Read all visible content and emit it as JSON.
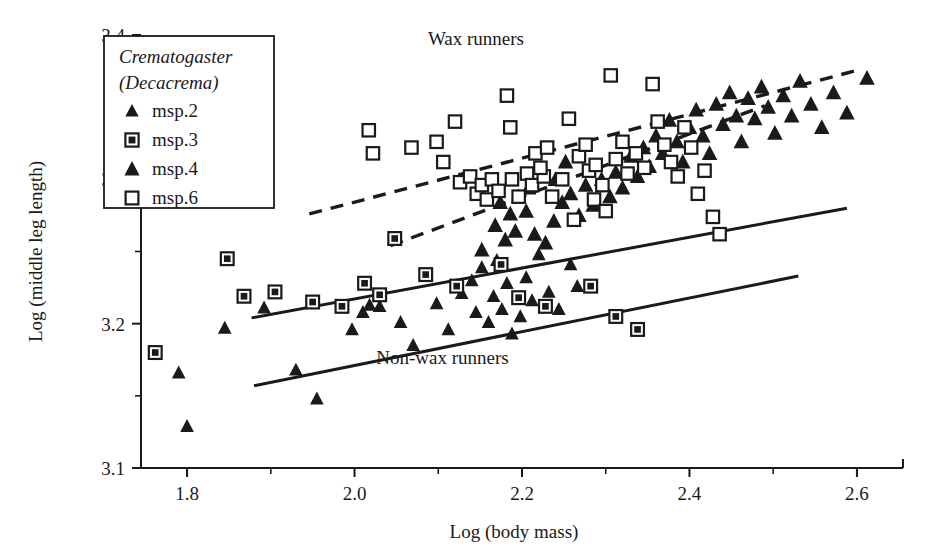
{
  "chart_data": {
    "type": "scatter",
    "title": "",
    "xlabel": "Log (body mass)",
    "ylabel": "Log (middle leg length)",
    "xlim": [
      1.745,
      2.655
    ],
    "ylim": [
      3.1,
      3.4
    ],
    "xticks": [
      1.8,
      2.0,
      2.2,
      2.4,
      2.6
    ],
    "xticklabels": [
      "1.8",
      "2.0",
      "2.2",
      "2.4",
      "2.6"
    ],
    "xminorticks": [
      1.9,
      2.1,
      2.3,
      2.5
    ],
    "yticks": [
      3.1,
      3.2,
      3.3,
      3.4
    ],
    "yticklabels": [
      "3.1",
      "3.2",
      "3.3",
      "3.4"
    ],
    "yminorticks": [
      3.15,
      3.25,
      3.35
    ],
    "grid": false,
    "legend_position": "top-left",
    "legend": {
      "title_line1": "Crematogaster",
      "title_line2": "(Decacrema)",
      "entries": [
        {
          "label": "msp.2",
          "marker": "triangle-small",
          "filled": true
        },
        {
          "label": "msp.3",
          "marker": "square-dotted",
          "filled": true
        },
        {
          "label": "msp.4",
          "marker": "triangle",
          "filled": true
        },
        {
          "label": "msp.6",
          "marker": "square-open",
          "filled": false
        }
      ]
    },
    "annotations": [
      {
        "text": "Wax runners",
        "x": 2.145,
        "y": 3.393
      },
      {
        "text": "Non-wax runners",
        "x": 2.105,
        "y": 3.172
      }
    ],
    "trendlines": [
      {
        "name": "wax-runners-upper-dashed",
        "style": "dashed",
        "x": [
          1.946,
          2.597
        ],
        "y": [
          3.276,
          3.375
        ]
      },
      {
        "name": "wax-runners-lower-dashed",
        "style": "dashed",
        "x": [
          2.043,
          2.49
        ],
        "y": [
          3.254,
          3.351
        ]
      },
      {
        "name": "non-wax-upper-solid",
        "style": "solid",
        "x": [
          1.877,
          2.588
        ],
        "y": [
          3.204,
          3.28
        ]
      },
      {
        "name": "non-wax-lower-solid",
        "style": "solid",
        "x": [
          1.88,
          2.53
        ],
        "y": [
          3.157,
          3.233
        ]
      }
    ],
    "series": [
      {
        "name": "msp.2",
        "marker": "triangle-small",
        "points": [
          [
            1.79,
            3.166
          ],
          [
            1.8,
            3.129
          ],
          [
            1.845,
            3.197
          ],
          [
            1.892,
            3.211
          ],
          [
            1.93,
            3.168
          ],
          [
            1.955,
            3.148
          ],
          [
            1.997,
            3.196
          ],
          [
            2.01,
            3.208
          ],
          [
            2.018,
            3.213
          ],
          [
            2.03,
            3.212
          ],
          [
            2.055,
            3.201
          ],
          [
            2.07,
            3.185
          ],
          [
            2.098,
            3.214
          ],
          [
            2.112,
            3.196
          ],
          [
            2.128,
            3.221
          ],
          [
            2.14,
            3.23
          ],
          [
            2.145,
            3.208
          ],
          [
            2.152,
            3.239
          ],
          [
            2.16,
            3.201
          ],
          [
            2.166,
            3.219
          ],
          [
            2.17,
            3.244
          ],
          [
            2.176,
            3.21
          ],
          [
            2.182,
            3.228
          ],
          [
            2.188,
            3.193
          ],
          [
            2.198,
            3.205
          ],
          [
            2.205,
            3.232
          ],
          [
            2.212,
            3.216
          ],
          [
            2.22,
            3.248
          ],
          [
            2.232,
            3.222
          ],
          [
            2.244,
            3.21
          ],
          [
            2.258,
            3.241
          ],
          [
            2.266,
            3.226
          ]
        ]
      },
      {
        "name": "msp.3",
        "marker": "square-dotted",
        "points": [
          [
            1.762,
            3.18
          ],
          [
            1.848,
            3.245
          ],
          [
            1.868,
            3.219
          ],
          [
            1.905,
            3.222
          ],
          [
            1.95,
            3.215
          ],
          [
            1.985,
            3.212
          ],
          [
            2.012,
            3.228
          ],
          [
            2.03,
            3.22
          ],
          [
            2.048,
            3.259
          ],
          [
            2.085,
            3.234
          ],
          [
            2.122,
            3.226
          ],
          [
            2.175,
            3.241
          ],
          [
            2.196,
            3.218
          ],
          [
            2.228,
            3.212
          ],
          [
            2.282,
            3.226
          ],
          [
            2.312,
            3.205
          ],
          [
            2.338,
            3.196
          ]
        ]
      },
      {
        "name": "msp.4",
        "marker": "triangle",
        "points": [
          [
            2.152,
            3.251
          ],
          [
            2.168,
            3.268
          ],
          [
            2.18,
            3.258
          ],
          [
            2.192,
            3.264
          ],
          [
            2.205,
            3.278
          ],
          [
            2.215,
            3.262
          ],
          [
            2.228,
            3.256
          ],
          [
            2.238,
            3.271
          ],
          [
            2.248,
            3.284
          ],
          [
            2.258,
            3.29
          ],
          [
            2.268,
            3.275
          ],
          [
            2.276,
            3.296
          ],
          [
            2.285,
            3.282
          ],
          [
            2.295,
            3.3
          ],
          [
            2.305,
            3.288
          ],
          [
            2.312,
            3.305
          ],
          [
            2.32,
            3.294
          ],
          [
            2.33,
            3.316
          ],
          [
            2.338,
            3.302
          ],
          [
            2.345,
            3.322
          ],
          [
            2.352,
            3.309
          ],
          [
            2.36,
            3.33
          ],
          [
            2.368,
            3.318
          ],
          [
            2.376,
            3.341
          ],
          [
            2.385,
            3.326
          ],
          [
            2.392,
            3.312
          ],
          [
            2.4,
            3.336
          ],
          [
            2.408,
            3.348
          ],
          [
            2.416,
            3.33
          ],
          [
            2.424,
            3.318
          ],
          [
            2.432,
            3.352
          ],
          [
            2.44,
            3.338
          ],
          [
            2.448,
            3.36
          ],
          [
            2.456,
            3.344
          ],
          [
            2.462,
            3.326
          ],
          [
            2.47,
            3.356
          ],
          [
            2.478,
            3.342
          ],
          [
            2.486,
            3.364
          ],
          [
            2.494,
            3.35
          ],
          [
            2.502,
            3.332
          ],
          [
            2.512,
            3.358
          ],
          [
            2.522,
            3.344
          ],
          [
            2.532,
            3.368
          ],
          [
            2.545,
            3.352
          ],
          [
            2.558,
            3.336
          ],
          [
            2.572,
            3.36
          ],
          [
            2.588,
            3.346
          ],
          [
            2.612,
            3.37
          ],
          [
            2.24,
            3.3
          ],
          [
            2.252,
            3.312
          ],
          [
            2.196,
            3.288
          ],
          [
            2.208,
            3.294
          ],
          [
            2.186,
            3.276
          ],
          [
            2.174,
            3.284
          ]
        ]
      },
      {
        "name": "msp.6",
        "marker": "square-open",
        "points": [
          [
            2.017,
            3.334
          ],
          [
            2.022,
            3.318
          ],
          [
            2.068,
            3.322
          ],
          [
            2.098,
            3.326
          ],
          [
            2.106,
            3.312
          ],
          [
            2.12,
            3.34
          ],
          [
            2.126,
            3.298
          ],
          [
            2.138,
            3.302
          ],
          [
            2.146,
            3.29
          ],
          [
            2.152,
            3.296
          ],
          [
            2.158,
            3.286
          ],
          [
            2.164,
            3.3
          ],
          [
            2.172,
            3.292
          ],
          [
            2.188,
            3.3
          ],
          [
            2.196,
            3.288
          ],
          [
            2.206,
            3.304
          ],
          [
            2.212,
            3.296
          ],
          [
            2.226,
            3.302
          ],
          [
            2.236,
            3.288
          ],
          [
            2.182,
            3.358
          ],
          [
            2.186,
            3.336
          ],
          [
            2.216,
            3.318
          ],
          [
            2.222,
            3.308
          ],
          [
            2.23,
            3.322
          ],
          [
            2.248,
            3.3
          ],
          [
            2.256,
            3.342
          ],
          [
            2.268,
            3.316
          ],
          [
            2.276,
            3.324
          ],
          [
            2.28,
            3.306
          ],
          [
            2.288,
            3.31
          ],
          [
            2.296,
            3.296
          ],
          [
            2.306,
            3.372
          ],
          [
            2.312,
            3.314
          ],
          [
            2.32,
            3.326
          ],
          [
            2.326,
            3.304
          ],
          [
            2.336,
            3.318
          ],
          [
            2.346,
            3.308
          ],
          [
            2.356,
            3.366
          ],
          [
            2.362,
            3.34
          ],
          [
            2.37,
            3.324
          ],
          [
            2.378,
            3.312
          ],
          [
            2.386,
            3.302
          ],
          [
            2.394,
            3.336
          ],
          [
            2.402,
            3.322
          ],
          [
            2.41,
            3.29
          ],
          [
            2.418,
            3.306
          ],
          [
            2.428,
            3.274
          ],
          [
            2.436,
            3.262
          ],
          [
            2.286,
            3.286
          ],
          [
            2.3,
            3.278
          ],
          [
            2.262,
            3.272
          ]
        ]
      }
    ]
  }
}
